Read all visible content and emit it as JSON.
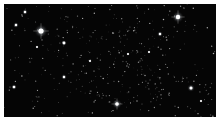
{
  "image": {
    "subject": "star field",
    "background_color": "#050505",
    "border_color": "#ffffff",
    "bright_stars": [
      {
        "x": 37,
        "y": 27,
        "r": 2.6,
        "glow": 7
      },
      {
        "x": 174,
        "y": 13,
        "r": 2.2,
        "glow": 6
      },
      {
        "x": 113,
        "y": 100,
        "r": 1.8,
        "glow": 5
      },
      {
        "x": 60,
        "y": 39,
        "r": 1.4,
        "glow": 3
      },
      {
        "x": 12,
        "y": 21,
        "r": 1.2,
        "glow": 3
      },
      {
        "x": 21,
        "y": 8,
        "r": 1.2,
        "glow": 3
      },
      {
        "x": 10,
        "y": 83,
        "r": 1.3,
        "glow": 3
      },
      {
        "x": 60,
        "y": 73,
        "r": 1.2,
        "glow": 3
      },
      {
        "x": 156,
        "y": 30,
        "r": 1.2,
        "glow": 3
      },
      {
        "x": 187,
        "y": 84,
        "r": 1.5,
        "glow": 4
      },
      {
        "x": 145,
        "y": 48,
        "r": 1.0,
        "glow": 2
      },
      {
        "x": 86,
        "y": 57,
        "r": 1.0,
        "glow": 2
      },
      {
        "x": 124,
        "y": 50,
        "r": 1.0,
        "glow": 2
      },
      {
        "x": 197,
        "y": 97,
        "r": 1.0,
        "glow": 2
      },
      {
        "x": 33,
        "y": 43,
        "r": 1.0,
        "glow": 2
      }
    ],
    "faint_star_count": 420,
    "faint_star_seed": 7
  }
}
